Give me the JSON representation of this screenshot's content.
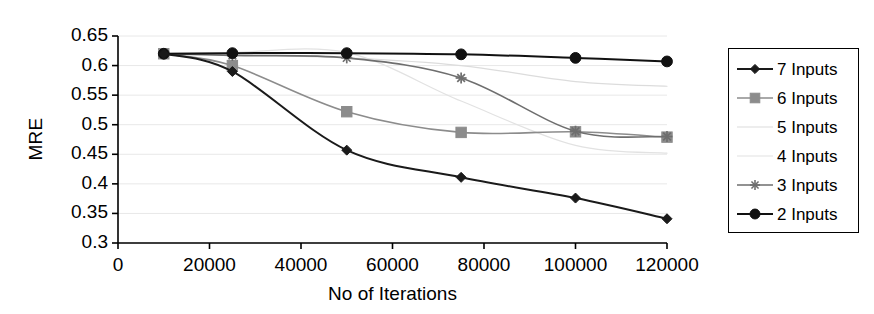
{
  "chart_data": {
    "type": "line",
    "title": "",
    "xlabel": "No of Iterations",
    "ylabel": "MRE",
    "x": [
      10000,
      25000,
      50000,
      75000,
      100000,
      120000
    ],
    "xlim": [
      0,
      120000
    ],
    "ylim": [
      0.3,
      0.65
    ],
    "xticks": [
      0,
      20000,
      40000,
      60000,
      80000,
      100000,
      120000
    ],
    "xtick_labels": [
      "0",
      "20000",
      "40000",
      "60000",
      "80000",
      "100000",
      "120000"
    ],
    "yticks": [
      0.3,
      0.35,
      0.4,
      0.45,
      0.5,
      0.55,
      0.6,
      0.65
    ],
    "ytick_labels": [
      "0.3",
      "0.35",
      "0.4",
      "0.45",
      "0.5",
      "0.55",
      "0.6",
      "0.65"
    ],
    "grid": true,
    "grid_axis": "y",
    "legend_position": "right-outside",
    "series": [
      {
        "name": "7 Inputs",
        "marker": "diamond",
        "color": "#1a1a1a",
        "line_width": 2.0,
        "values": [
          0.62,
          0.59,
          0.457,
          0.411,
          0.376,
          0.341
        ]
      },
      {
        "name": "6 Inputs",
        "marker": "square",
        "color": "#8c8c8c",
        "line_width": 1.6,
        "values": [
          0.62,
          0.6,
          0.522,
          0.487,
          0.488,
          0.479
        ]
      },
      {
        "name": "5 Inputs",
        "marker": "none",
        "color": "#dcdcdc",
        "line_width": 1.2,
        "values": [
          0.62,
          0.618,
          0.613,
          0.6,
          0.573,
          0.565
        ]
      },
      {
        "name": "4 Inputs",
        "marker": "none",
        "color": "#e2e2e2",
        "line_width": 1.2,
        "values": [
          0.62,
          0.622,
          0.622,
          0.54,
          0.465,
          0.452
        ]
      },
      {
        "name": "3 Inputs",
        "marker": "asterisk",
        "color": "#6e6e6e",
        "line_width": 1.6,
        "values": [
          0.62,
          0.617,
          0.613,
          0.579,
          0.489,
          0.48
        ]
      },
      {
        "name": "2 Inputs",
        "marker": "circle",
        "color": "#111111",
        "line_width": 2.0,
        "values": [
          0.62,
          0.621,
          0.621,
          0.619,
          0.613,
          0.607
        ]
      }
    ]
  },
  "legend": {
    "entries": [
      {
        "label": "7 Inputs"
      },
      {
        "label": "6 Inputs"
      },
      {
        "label": "5 Inputs"
      },
      {
        "label": "4 Inputs"
      },
      {
        "label": "3 Inputs"
      },
      {
        "label": "2 Inputs"
      }
    ]
  },
  "colors": {
    "axis": "#000000",
    "grid": "#e8e8e8",
    "background": "#ffffff"
  }
}
